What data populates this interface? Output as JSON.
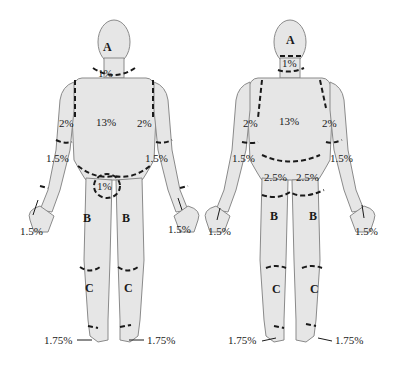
{
  "colors": {
    "skin": "#e6e6e6",
    "outline": "#8a8a8a",
    "dash": "#1a1a1a",
    "text": "#1a1a1a"
  },
  "anterior": {
    "head": "A",
    "neck": "1%",
    "trunk": "13%",
    "upper_arm_left": "2%",
    "upper_arm_right": "2%",
    "forearm_left": "1.5%",
    "forearm_right": "1.5%",
    "genitals": "1%",
    "hand_left": "1.5%",
    "hand_right": "1.5%",
    "thigh_left": "B",
    "thigh_right": "B",
    "leg_left": "C",
    "leg_right": "C",
    "foot_left": "1.75%",
    "foot_right": "1.75%"
  },
  "posterior": {
    "head": "A",
    "neck": "1%",
    "trunk": "13%",
    "upper_arm_left": "2%",
    "upper_arm_right": "2%",
    "forearm_left": "1.5%",
    "forearm_right": "1.5%",
    "buttock_left": "2.5%",
    "buttock_right": "2.5%",
    "hand_left": "1.5%",
    "hand_right": "1.5%",
    "thigh_left": "B",
    "thigh_right": "B",
    "leg_left": "C",
    "leg_right": "C",
    "foot_left": "1.75%",
    "foot_right": "1.75%"
  }
}
